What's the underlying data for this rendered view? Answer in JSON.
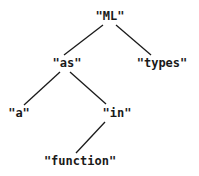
{
  "diagram": {
    "type": "tree",
    "nodes": [
      {
        "id": "ml",
        "label": "\"ML\"",
        "x": 110,
        "y": 16
      },
      {
        "id": "as",
        "label": "\"as\"",
        "x": 67,
        "y": 63
      },
      {
        "id": "types",
        "label": "\"types\"",
        "x": 162,
        "y": 63
      },
      {
        "id": "a",
        "label": "\"a\"",
        "x": 19,
        "y": 113
      },
      {
        "id": "in",
        "label": "\"in\"",
        "x": 117,
        "y": 113
      },
      {
        "id": "function",
        "label": "\"function\"",
        "x": 80,
        "y": 161
      }
    ],
    "edges": [
      {
        "from": "ml",
        "to": "as",
        "x1": 103,
        "y1": 25,
        "x2": 64,
        "y2": 55
      },
      {
        "from": "ml",
        "to": "types",
        "x1": 116,
        "y1": 25,
        "x2": 151,
        "y2": 55
      },
      {
        "from": "as",
        "to": "a",
        "x1": 60,
        "y1": 72,
        "x2": 24,
        "y2": 105
      },
      {
        "from": "as",
        "to": "in",
        "x1": 70,
        "y1": 72,
        "x2": 106,
        "y2": 104
      },
      {
        "from": "in",
        "to": "function",
        "x1": 105,
        "y1": 122,
        "x2": 76,
        "y2": 153
      }
    ],
    "colors": {
      "line": "#1a1a1a",
      "text": "#1a1a1a",
      "background": "#ffffff"
    }
  }
}
